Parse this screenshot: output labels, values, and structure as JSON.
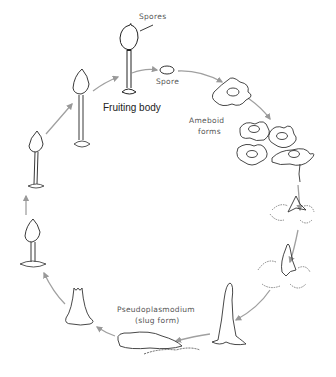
{
  "diagram": {
    "type": "life-cycle",
    "colors": {
      "line": "#333333",
      "arrow": "#999999",
      "label": "#555555",
      "background": "#ffffff"
    },
    "labels": {
      "spores": "Spores",
      "spore": "Spore",
      "fruiting_body": "Fruiting body",
      "ameboid_1": "Ameboid",
      "ameboid_2": "forms",
      "pseudo_1": "Pseudoplasmodium",
      "pseudo_2": "(slug form)"
    },
    "stages": [
      "Fruiting body",
      "Spore",
      "Ameboid forms",
      "Aggregation",
      "Aggregation mound",
      "Rising column",
      "Pseudoplasmodium (slug form)",
      "Culmination",
      "Early fruiting body",
      "Elongating fruiting body",
      "Mature stalk"
    ]
  }
}
